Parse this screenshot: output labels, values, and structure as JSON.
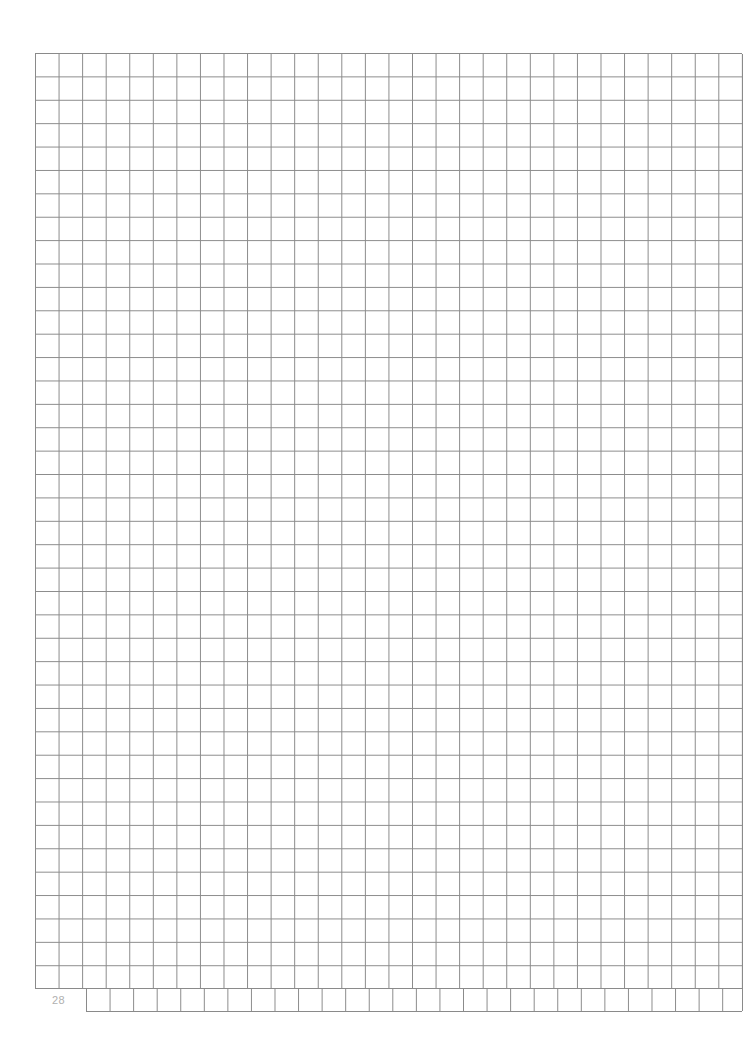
{
  "page": {
    "type": "graph-paper",
    "page_number": "28",
    "grid": {
      "columns": 30,
      "rows": 41,
      "notch": "bottom-left 2 columns of last row omitted (page number area)",
      "line_color": "#8a8a8a",
      "background": "#ffffff"
    }
  }
}
